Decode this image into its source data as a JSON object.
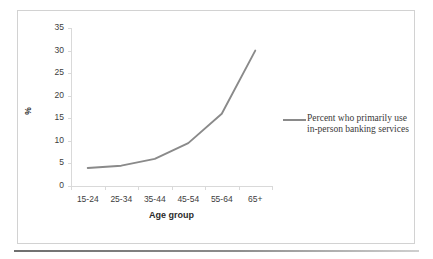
{
  "chart_data": {
    "type": "line",
    "title": "",
    "subtitle": "",
    "xlabel": "Age group",
    "ylabel": "%",
    "categories": [
      "15-24",
      "25-34",
      "35-44",
      "45-54",
      "55-64",
      "65+"
    ],
    "series": [
      {
        "name": "Percent who primarily use in-person banking services",
        "values": [
          4,
          4.5,
          6,
          9.5,
          16,
          30
        ],
        "color": "#8a8a8a"
      }
    ],
    "ylim": [
      0,
      35
    ],
    "yticks": [
      0,
      5,
      10,
      15,
      20,
      25,
      30,
      35
    ],
    "ytick_labels": [
      "0",
      "5",
      "10",
      "15",
      "20",
      "25",
      "30",
      "35"
    ],
    "grid": false,
    "markers": false,
    "legend_position": "right"
  },
  "legend": {
    "entries": [
      {
        "line1": "Percent who primarily use",
        "line2": "in-person banking services"
      }
    ]
  },
  "colors": {
    "series_line": "#8a8a8a",
    "axis": "#d9d9d9",
    "tick_text": "#3d3d3d",
    "title_text": "#2b2b2b",
    "frame_border": "#d2d2d2",
    "bottom_rule": "#6f6f6f"
  }
}
